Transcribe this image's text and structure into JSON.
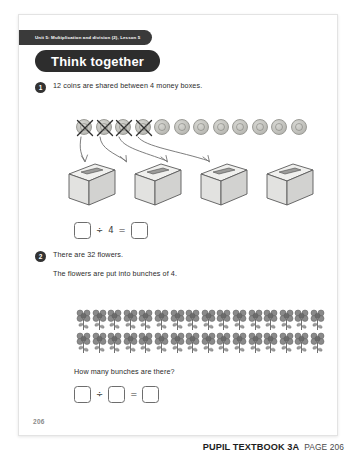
{
  "document": {
    "type": "textbook-page",
    "page_number": "206",
    "unit_tab": "Unit 5: Multiplication and division (2), Lesson 5",
    "section_banner": "Think together"
  },
  "questions": [
    {
      "number": "1",
      "text": "12 coins are shared between 4 money boxes.",
      "coins": {
        "total": 12,
        "crossed_out": 4,
        "remaining": 8,
        "icon": "coin-icon"
      },
      "money_boxes": {
        "count": 4,
        "icon": "money-box-icon"
      },
      "arrows": {
        "count": 4,
        "icon": "pencil-arrow-icon"
      },
      "answer": {
        "cells": [
          "",
          "4",
          ""
        ],
        "operators": [
          "÷",
          "="
        ]
      }
    },
    {
      "number": "2",
      "text": "There are 32 flowers.",
      "subtext": "The flowers are put into bunches of 4.",
      "flowers": {
        "total": 32,
        "rows": 2,
        "per_row": 16,
        "icon": "flower-icon"
      },
      "prompt": "How many bunches are there?",
      "answer": {
        "cells": [
          "",
          "",
          ""
        ],
        "operators": [
          "÷",
          "="
        ]
      }
    }
  ],
  "footer": {
    "title": "PUPIL TEXTBOOK 3A",
    "page_label": "PAGE 206"
  },
  "colors": {
    "banner_dark": "#2d2d2d",
    "tab_dark": "#3a3a3a",
    "text": "#2b2b2b",
    "box_outline": "#6d6d6d",
    "page_bg": "#ffffff",
    "coin": "#c2c2bd",
    "flower": "#7f7f7f"
  }
}
